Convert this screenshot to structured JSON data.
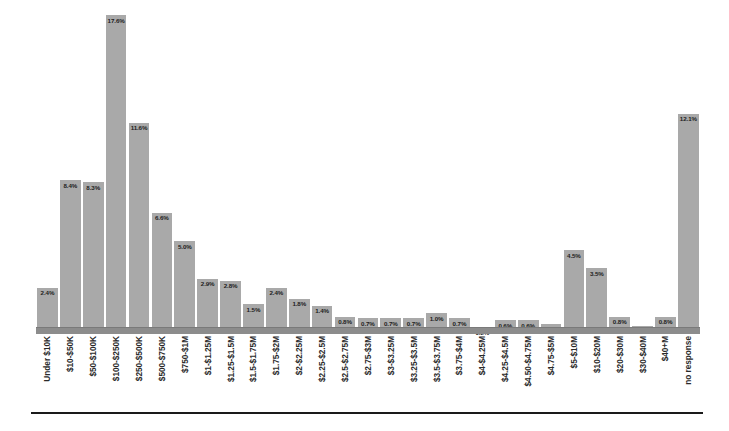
{
  "chart_data": {
    "type": "bar",
    "title": "",
    "subtitle": "",
    "xlabel": "",
    "ylabel": "",
    "ylim": [
      0,
      18
    ],
    "grid": false,
    "legend": null,
    "orientation": "vertical",
    "value_label_position": "inside-top",
    "value_suffix": "%",
    "bar_color": "#a9a9a9",
    "baseline_color": "#8c8c8c",
    "rule_color": "#1a1a1a",
    "label_color": "#1c1c1c",
    "categories": [
      "Under $10K",
      "$10-$50K",
      "$50-$100K",
      "$100-$250K",
      "$250-$500K",
      "$500-$750K",
      "$750-$1M",
      "$1-$1.25M",
      "$1.25-$1.5M",
      "$1.5-$1.75M",
      "$1.75-$2M",
      "$2-$2.25M",
      "$2.25-$2.5M",
      "$2.5-$2.75M",
      "$2.75-$3M",
      "$3-$3.25M",
      "$3.25-$3.5M",
      "$3.5-$3.75M",
      "$3.75-$4M",
      "$4-$4.25M",
      "$4.25-$4.5M",
      "$4.50-$4.75M",
      "$4.75-$5M",
      "$5-$10M",
      "$10-$20M",
      "$20-$30M",
      "$30-$40M",
      "$40+M",
      "no response"
    ],
    "values": [
      2.4,
      8.4,
      8.3,
      17.6,
      11.6,
      6.6,
      5.0,
      2.9,
      2.8,
      1.5,
      2.4,
      1.8,
      1.4,
      0.8,
      0.7,
      0.7,
      0.7,
      1.0,
      0.7,
      0.2,
      0.6,
      0.6,
      0.4,
      4.5,
      3.5,
      0.8,
      0.3,
      0.8,
      12.1
    ],
    "value_labels": [
      "2.4%",
      "8.4%",
      "8.3%",
      "17.6%",
      "11.6%",
      "6.6%",
      "5.0%",
      "2.9%",
      "2.8%",
      "1.5%",
      "2.4%",
      "1.8%",
      "1.4%",
      "0.8%",
      "0.7%",
      "0.7%",
      "0.7%",
      "1.0%",
      "0.7%",
      "0.2%",
      "0.6%",
      "0.6%",
      "0.4%",
      "4.5%",
      "3.5%",
      "0.8%",
      "0.3%",
      "0.8%",
      "12.1%"
    ]
  }
}
